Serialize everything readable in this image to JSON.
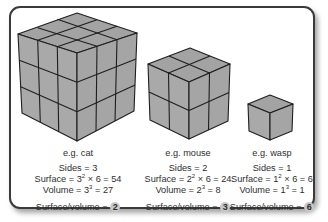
{
  "diagram": {
    "colors": {
      "cube_face": "#a7a7a7",
      "cube_edge": "#1e1e1e",
      "frame_border": "#3a3a3a",
      "badge": "#c8c8c8",
      "text": "#2e2e2e"
    },
    "cubes": [
      {
        "example": "e.g. cat",
        "sides_label": "Sides = 3",
        "surface_prefix": "Surface = 3",
        "surface_exp": "2",
        "surface_suffix": " × 6 = 54",
        "volume_prefix": "Volume = 3",
        "volume_exp": "3",
        "volume_suffix": " = 27",
        "ratio_label": "Surface/volume = ",
        "ratio_value": "2",
        "grid": 3
      },
      {
        "example": "e.g. mouse",
        "sides_label": "Sides = 2",
        "surface_prefix": "Surface = 2",
        "surface_exp": "2",
        "surface_suffix": " × 6 = 24",
        "volume_prefix": "Volume = 2",
        "volume_exp": "3",
        "volume_suffix": " = 8",
        "ratio_label": "Surface/volume = ",
        "ratio_value": "3",
        "grid": 2
      },
      {
        "example": "e.g. wasp",
        "sides_label": "Sides = 1",
        "surface_prefix": "Surface = 1",
        "surface_exp": "2",
        "surface_suffix": " × 6 = 6",
        "volume_prefix": "Volume = 1",
        "volume_exp": "3",
        "volume_suffix": " = 1",
        "ratio_label": "Surface/volume = ",
        "ratio_value": "6",
        "grid": 1
      }
    ]
  }
}
